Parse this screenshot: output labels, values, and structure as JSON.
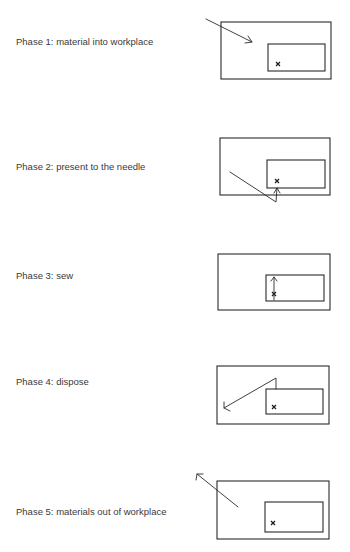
{
  "phases": [
    {
      "label": "Phase 1: material into workplace",
      "label_y": 41,
      "outer": {
        "x": 221,
        "y": 22,
        "w": 110,
        "h": 57
      },
      "inner": {
        "x": 268,
        "y": 44,
        "w": 57,
        "h": 27
      },
      "mark": {
        "x": 278,
        "y": 64
      },
      "path": "M206 19 L252 42",
      "arrowhead": "M248 36 L252 42 L245 43",
      "arrow_meaning": "material moves into workplace"
    },
    {
      "label": "Phase 2: present to the needle",
      "label_y": 166,
      "outer": {
        "x": 220,
        "y": 138,
        "w": 110,
        "h": 57
      },
      "inner": {
        "x": 267,
        "y": 160,
        "w": 58,
        "h": 28
      },
      "mark": {
        "x": 277,
        "y": 181
      },
      "path": "M230 172 L276 202 L277 188",
      "arrowhead": "M274 193 L277 188 L280 193",
      "arrow_meaning": "material presented up to the needle"
    },
    {
      "label": "Phase 3: sew",
      "label_y": 275,
      "outer": {
        "x": 218,
        "y": 254,
        "w": 112,
        "h": 56
      },
      "inner": {
        "x": 266,
        "y": 275,
        "w": 58,
        "h": 26
      },
      "mark": {
        "x": 274,
        "y": 294
      },
      "path": "M274 300 L274 277",
      "arrowhead": "M271 281 L274 277 L277 281",
      "arrow_meaning": "sewing along seam"
    },
    {
      "label": "Phase 4: dispose",
      "label_y": 381,
      "outer": {
        "x": 217,
        "y": 366,
        "w": 112,
        "h": 58
      },
      "inner": {
        "x": 266,
        "y": 389,
        "w": 57,
        "h": 25
      },
      "mark": {
        "x": 274,
        "y": 407
      },
      "path": "M276 389 L276 378 L224 408",
      "arrowhead": "M224 402 L224 408 L230 411",
      "arrow_meaning": "finished part disposed"
    },
    {
      "label": "Phase 5: materials out of workplace",
      "label_y": 511,
      "outer": {
        "x": 217,
        "y": 481,
        "w": 112,
        "h": 58
      },
      "inner": {
        "x": 265,
        "y": 502,
        "w": 58,
        "h": 30
      },
      "mark": {
        "x": 273,
        "y": 523
      },
      "path": "M238 507 L197 474",
      "arrowhead": "M196 480 L197 474 L203 474",
      "arrow_meaning": "materials move out of workplace"
    }
  ],
  "mark_glyph": "×",
  "colors": {
    "ink": "#2a2a2a",
    "text": "#3a3a3a",
    "background": "#ffffff"
  }
}
